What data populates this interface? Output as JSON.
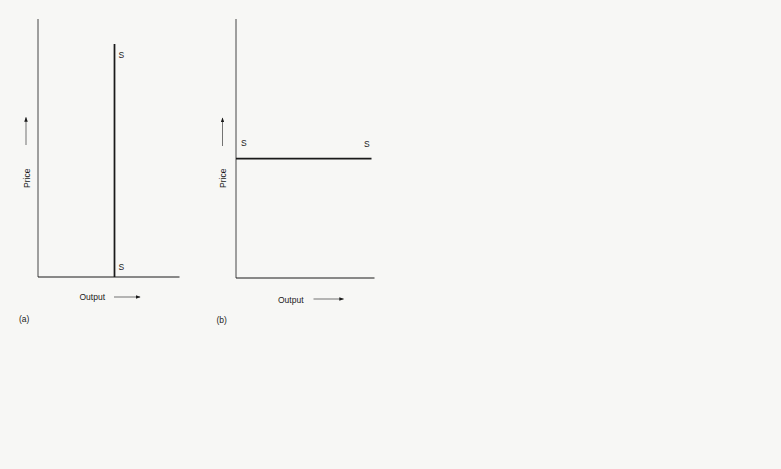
{
  "figure": {
    "panels": [
      {
        "id": "a",
        "caption": "(a)",
        "y_axis_label": "Price",
        "x_axis_label": "Output",
        "curve_label_top": "S",
        "curve_label_bottom": "S",
        "curve_type": "vertical"
      },
      {
        "id": "b",
        "caption": "(b)",
        "y_axis_label": "Price",
        "x_axis_label": "Output",
        "curve_label_left": "S",
        "curve_label_right": "S",
        "curve_type": "horizontal"
      }
    ]
  },
  "colors": {
    "ink": "#1a1a1a",
    "background": "#f7f7f5"
  }
}
